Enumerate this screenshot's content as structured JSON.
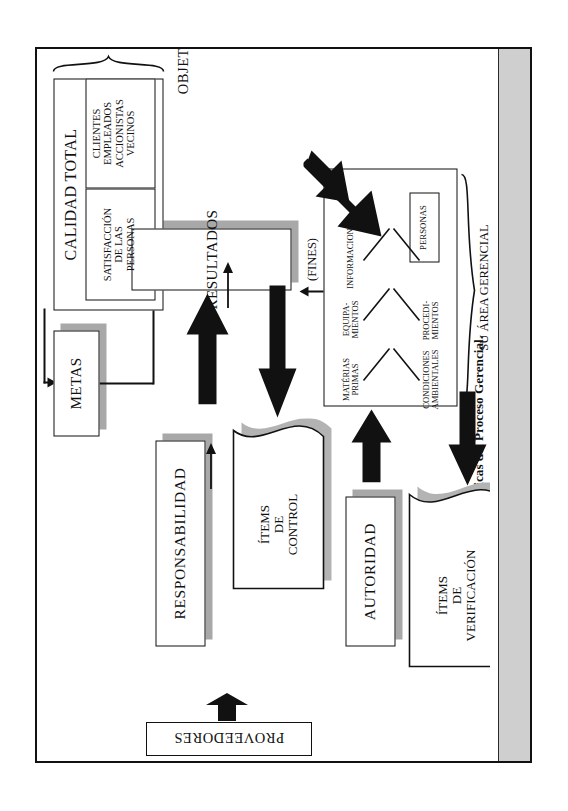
{
  "figure": {
    "caption": "Figura 8.1: Características Básicas del Proceso Gerencial."
  },
  "diagram": {
    "title_inline": "CALIDAD TOTAL",
    "nodes": {
      "calidad_total": "CALIDAD TOTAL",
      "satisfaccion": "SATISFACCIÓN\nDE LAS\nPERSONAS",
      "stakeholders": "CLIENTES\nEMPLEADOS\nACCIONISTAS\nVECINOS",
      "metas": "METAS",
      "resultados": "RESULTADOS",
      "proveedores": "PROVEEDORES",
      "personas": "PERSONAS"
    },
    "side_labels": {
      "responsabilidad": "RESPONSABILIDAD",
      "autoridad": "AUTORIDAD"
    },
    "braces": {
      "objetivo": "OBJETIVO",
      "area_gerencial": "SU ÁREA GERENCIAL\n(MEDIOS)"
    },
    "annotations": {
      "fines": "(FINES)"
    },
    "documents": {
      "items_control": "ÍTEMS\nDE\nCONTROL",
      "items_verificacion": "ÍTEMS\nDE\nVERIFICACIÓN"
    },
    "fishbone": {
      "left_branches": [
        "INFORMACIONES",
        "EQUIPA-\nMIENTOS",
        "MATÉRIAS\nPRIMAS"
      ],
      "right_branches": [
        "PERSONAS",
        "PROCEDI-\nMIENTOS",
        "CONDICIONES\nAMBIENTALES"
      ]
    }
  },
  "colors": {
    "ink": "#111111",
    "shadow": "#a8a8a8",
    "page_edge": "#cfcfcf",
    "paper": "#ffffff"
  }
}
